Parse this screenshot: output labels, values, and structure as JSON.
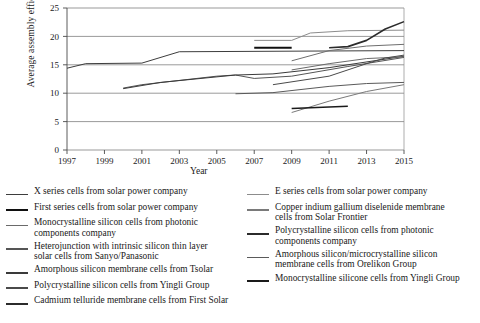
{
  "chart_data": {
    "type": "line",
    "title": "",
    "xlabel": "Year",
    "ylabel": "Average assembly efficiency (%)",
    "xlim": [
      1997,
      2015
    ],
    "ylim": [
      0,
      25
    ],
    "xticks": [
      "1997",
      "1999",
      "2001",
      "2003",
      "2005",
      "2007",
      "2009",
      "2011",
      "2013",
      "2015"
    ],
    "yticks": [
      "0",
      "5",
      "10",
      "15",
      "20",
      "25"
    ],
    "grid": "horizontal",
    "legend_position": "below",
    "series": [
      {
        "name": "X series cells from solar power company",
        "color": "#3d3d3d",
        "width": 1.0,
        "points": [
          [
            1997,
            14.4
          ],
          [
            1998,
            15.2
          ],
          [
            2001,
            15.3
          ],
          [
            2003,
            17.3
          ],
          [
            2015,
            17.5
          ]
        ]
      },
      {
        "name": "E series cells from solar power company",
        "color": "#8c8c8c",
        "width": 1.0,
        "points": [
          [
            2007,
            19.3
          ],
          [
            2009,
            19.3
          ],
          [
            2010,
            20.6
          ],
          [
            2012,
            21.0
          ],
          [
            2015,
            21.1
          ]
        ]
      },
      {
        "name": "First series cells from solar power company",
        "color": "#101010",
        "width": 2.2,
        "points": [
          [
            2007,
            18.0
          ],
          [
            2009,
            18.0
          ]
        ]
      },
      {
        "name": "Copper indium gallium diselenide membrane cells from Solar Frontier",
        "color": "#6e6e6e",
        "width": 1.0,
        "points": [
          [
            2009,
            15.7
          ],
          [
            2011,
            17.5
          ],
          [
            2013,
            18.3
          ],
          [
            2015,
            18.6
          ]
        ]
      },
      {
        "name": "Monocrystalline silicon cells from photonic components company",
        "color": "#555555",
        "width": 1.0,
        "points": [
          [
            2000,
            10.9
          ],
          [
            2001,
            11.5
          ],
          [
            2005,
            13.0
          ],
          [
            2006,
            13.2
          ],
          [
            2007,
            12.6
          ],
          [
            2009,
            13.0
          ],
          [
            2012,
            14.7
          ],
          [
            2015,
            16.3
          ]
        ]
      },
      {
        "name": "Polycrystalline silicon cells from photonic components company",
        "color": "#2b2b2b",
        "width": 1.6,
        "points": [
          [
            2011,
            18.0
          ],
          [
            2012,
            18.2
          ],
          [
            2013,
            19.3
          ],
          [
            2014,
            21.3
          ],
          [
            2015,
            22.6
          ]
        ]
      },
      {
        "name": "Heterojunction with intrinsic silicon thin layer solar cells from Sanyo/Panasonic",
        "color": "#3a3a3a",
        "width": 1.0,
        "points": [
          [
            2000,
            10.8
          ],
          [
            2002,
            11.9
          ],
          [
            2006,
            13.2
          ],
          [
            2008,
            13.4
          ],
          [
            2011,
            14.5
          ],
          [
            2015,
            16.5
          ]
        ]
      },
      {
        "name": "Amorphous silicon/microcrystalline silicon membrane cells from Orelikon Group",
        "color": "#7a7a7a",
        "width": 1.0,
        "points": [
          [
            2009,
            6.6
          ],
          [
            2011,
            8.6
          ],
          [
            2013,
            10.3
          ],
          [
            2015,
            11.5
          ]
        ]
      },
      {
        "name": "Amorphous silicon membrane cells from Tsolar",
        "color": "#5a5a5a",
        "width": 1.0,
        "points": [
          [
            2006,
            9.9
          ],
          [
            2008,
            10.1
          ],
          [
            2011,
            11.2
          ],
          [
            2013,
            11.7
          ],
          [
            2015,
            11.9
          ]
        ]
      },
      {
        "name": "Polycrystalline silicon cells from Yingli Group",
        "color": "#6a6a6a",
        "width": 1.0,
        "points": [
          [
            2009,
            14.1
          ],
          [
            2011,
            15.2
          ],
          [
            2013,
            16.1
          ],
          [
            2015,
            16.4
          ]
        ]
      },
      {
        "name": "Monocrystalline silicone cells from Yingli Group",
        "color": "#1a1a1a",
        "width": 1.6,
        "points": [
          [
            2009,
            7.3
          ],
          [
            2012,
            7.7
          ]
        ]
      },
      {
        "name": "Cadmium telluride membrane cells from First Solar",
        "color": "#4a4a4a",
        "width": 1.0,
        "points": [
          [
            2008,
            11.5
          ],
          [
            2011,
            13.0
          ],
          [
            2013,
            15.2
          ],
          [
            2014,
            16.2
          ],
          [
            2015,
            16.7
          ]
        ]
      }
    ]
  },
  "legend": {
    "left_items": [
      {
        "label": "X series cells from solar power company",
        "color": "#3d3d3d",
        "width": 1.6
      },
      {
        "label": "First series cells from solar power company",
        "color": "#101010",
        "width": 2.4
      },
      {
        "label": "Monocrystalline silicon cells from photonic\ncomponents company",
        "color": "#6a6a6a",
        "width": 1.4
      },
      {
        "label": "Heterojunction with intrinsic silicon thin layer\nsolar cells from Sanyo/Panasonic",
        "color": "#555555",
        "width": 1.6
      },
      {
        "label": "Amorphous silicon membrane cells from Tsolar",
        "color": "#3a3a3a",
        "width": 1.8
      },
      {
        "label": "Polycrystalline silicon cells from Yingli Group",
        "color": "#4a4a4a",
        "width": 1.8
      },
      {
        "label": "Cadmium telluride membrane cells from First Solar",
        "color": "#2b2b2b",
        "width": 2.0
      }
    ],
    "right_items": [
      {
        "label": "E series cells from solar power company",
        "color": "#8c8c8c",
        "width": 1.4
      },
      {
        "label": "Copper indium gallium diselenide membrane\n cells from Solar Frontier",
        "color": "#7a7a7a",
        "width": 1.4
      },
      {
        "label": "Polycrystalline silicon cells from photonic\ncomponents company",
        "color": "#2b2b2b",
        "width": 2.0
      },
      {
        "label": "Amorphous silicon/microcrystalline silicon\nmembrane cells from Orelikon Group",
        "color": "#5a5a5a",
        "width": 1.6
      },
      {
        "label": "Monocrystalline silicone cells from Yingli Group",
        "color": "#1a1a1a",
        "width": 2.2
      }
    ]
  }
}
